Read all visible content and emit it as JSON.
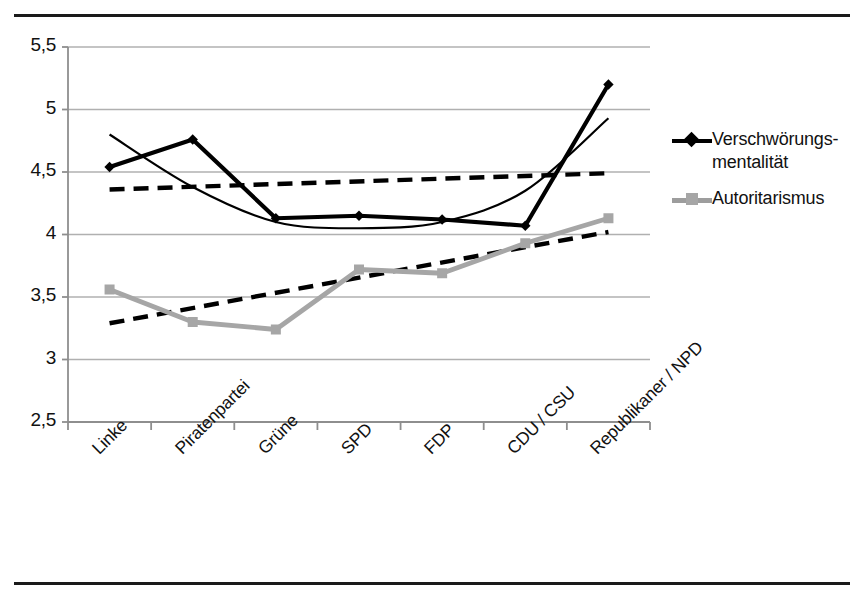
{
  "figure": {
    "top_rule": "",
    "bottom_rule": ""
  },
  "legend": {
    "position": "right",
    "items": [
      {
        "label_line1": "Verschwörungs-",
        "label_line2": "mentalität",
        "marker": "diamond-marker-icon",
        "color": "#000000"
      },
      {
        "label_line1": "Autoritarismus",
        "label_line2": "",
        "marker": "square-marker-icon",
        "color": "#a6a6a6"
      }
    ]
  },
  "chart_data": {
    "type": "line",
    "title": "",
    "subtitle": "",
    "xlabel": "",
    "ylabel": "",
    "categories": [
      "Linke",
      "Piratenpartei",
      "Grüne",
      "SPD",
      "FDP",
      "CDU / CSU",
      "Republikaner / NPD"
    ],
    "ylim": [
      2.5,
      5.5
    ],
    "yticks": [
      "2,5",
      "3",
      "3,5",
      "4",
      "4,5",
      "5",
      "5,5"
    ],
    "ytick_values": [
      2.5,
      3.0,
      3.5,
      4.0,
      4.5,
      5.0,
      5.5
    ],
    "grid": "horizontal",
    "legend_position": "right",
    "series": [
      {
        "name": "Verschwörungsmentalität",
        "color": "#000000",
        "marker": "diamond",
        "values": [
          4.54,
          4.76,
          4.13,
          4.15,
          4.12,
          4.07,
          5.2
        ]
      },
      {
        "name": "Autoritarismus",
        "color": "#a6a6a6",
        "marker": "square",
        "values": [
          3.56,
          3.3,
          3.24,
          3.72,
          3.69,
          3.93,
          4.13
        ]
      }
    ],
    "trendlines": [
      {
        "name": "Verschwörungsmentalität linear trend",
        "style": "dashed",
        "color": "#000000",
        "for_series": "Verschwörungsmentalität",
        "start_value": 4.36,
        "end_value": 4.49
      },
      {
        "name": "Autoritarismus linear trend",
        "style": "dashed",
        "color": "#000000",
        "for_series": "Autoritarismus",
        "start_value": 3.29,
        "end_value": 4.02
      },
      {
        "name": "Verschwörungsmentalität polynomial trend",
        "style": "solid-thin",
        "color": "#000000",
        "for_series": "Verschwörungsmentalität",
        "points": [
          4.8,
          4.38,
          4.1,
          4.05,
          4.1,
          4.35,
          4.93
        ]
      }
    ]
  }
}
